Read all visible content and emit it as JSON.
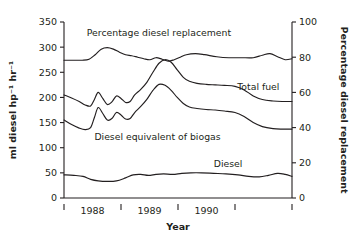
{
  "chart_data": {
    "type": "line",
    "title": "",
    "xlabel": "Year",
    "ylabel": "ml diesel hp⁻¹ hr⁻¹",
    "y2label": "Percentage diesel replacement",
    "xlim": [
      1987.75,
      1990.75
    ],
    "ylim": [
      0,
      350
    ],
    "y2lim": [
      0,
      100
    ],
    "grid": false,
    "legend": "inline-annotations",
    "yticks": [
      0,
      50,
      100,
      150,
      200,
      250,
      300,
      350
    ],
    "ytick_labels": [
      "0",
      "50",
      "100",
      "150",
      "200",
      "250",
      "300",
      "350"
    ],
    "y2ticks": [
      0,
      20,
      40,
      60,
      80,
      100
    ],
    "y2tick_labels": [
      "0",
      "20",
      "40",
      "60",
      "80",
      "100"
    ],
    "xticks": [
      1987.75,
      1988.5,
      1989.25,
      1990.0,
      1990.75
    ],
    "xtick_labels": [
      "",
      "1988",
      "1989",
      "1990",
      ""
    ],
    "xtick_text": [
      "1988",
      "1989",
      "1990"
    ],
    "series": [
      {
        "name": "Percentage diesel replacement",
        "axis": "right",
        "label_x": 1988.05,
        "label_y": 322,
        "x": [
          1987.75,
          1987.87,
          1987.99,
          1988.08,
          1988.16,
          1988.24,
          1988.32,
          1988.4,
          1988.48,
          1988.56,
          1988.64,
          1988.72,
          1988.8,
          1988.88,
          1988.96,
          1989.04,
          1989.12,
          1989.2,
          1989.28,
          1989.36,
          1989.48,
          1989.6,
          1989.76,
          1989.92,
          1990.08,
          1990.24,
          1990.36,
          1990.46,
          1990.56,
          1990.66,
          1990.75
        ],
        "values_left_scale": [
          274,
          274,
          274,
          276,
          285,
          296,
          299,
          296,
          290,
          285,
          283,
          280,
          277,
          275,
          279,
          276,
          272,
          275,
          280,
          285,
          287,
          285,
          281,
          279,
          279,
          279,
          284,
          287,
          281,
          275,
          277
        ]
      },
      {
        "name": "Total fuel",
        "axis": "left",
        "label_x": 1990.03,
        "label_y": 214,
        "x": [
          1987.75,
          1987.85,
          1987.95,
          1988.03,
          1988.1,
          1988.15,
          1988.2,
          1988.26,
          1988.32,
          1988.38,
          1988.44,
          1988.5,
          1988.56,
          1988.62,
          1988.68,
          1988.76,
          1988.84,
          1988.92,
          1989.0,
          1989.08,
          1989.16,
          1989.24,
          1989.32,
          1989.4,
          1989.5,
          1989.62,
          1989.74,
          1989.86,
          1990.0,
          1990.12,
          1990.24,
          1990.36,
          1990.5,
          1990.62,
          1990.75
        ],
        "values_left_scale": [
          205,
          199,
          192,
          185,
          183,
          196,
          210,
          198,
          186,
          191,
          203,
          198,
          190,
          192,
          205,
          216,
          230,
          250,
          268,
          275,
          270,
          255,
          240,
          232,
          228,
          226,
          225,
          224,
          222,
          215,
          203,
          196,
          193,
          192,
          192
        ]
      },
      {
        "name": "Diesel equivalent of biogas",
        "axis": "left",
        "label_x": 1988.15,
        "label_y": 116,
        "x": [
          1987.75,
          1987.85,
          1987.95,
          1988.03,
          1988.1,
          1988.15,
          1988.2,
          1988.26,
          1988.32,
          1988.38,
          1988.44,
          1988.5,
          1988.56,
          1988.62,
          1988.68,
          1988.76,
          1988.84,
          1988.92,
          1989.0,
          1989.08,
          1989.16,
          1989.24,
          1989.32,
          1989.4,
          1989.5,
          1989.62,
          1989.74,
          1989.86,
          1990.0,
          1990.12,
          1990.24,
          1990.36,
          1990.5,
          1990.62,
          1990.75
        ],
        "values_left_scale": [
          155,
          146,
          139,
          136,
          140,
          160,
          180,
          168,
          155,
          158,
          170,
          165,
          157,
          158,
          170,
          182,
          196,
          214,
          226,
          224,
          214,
          200,
          188,
          181,
          178,
          176,
          175,
          173,
          170,
          162,
          150,
          142,
          138,
          137,
          137
        ]
      },
      {
        "name": "Diesel",
        "axis": "left",
        "label_x": 1989.72,
        "label_y": 62,
        "x": [
          1987.75,
          1987.88,
          1988.0,
          1988.1,
          1988.2,
          1988.32,
          1988.44,
          1988.56,
          1988.66,
          1988.76,
          1988.86,
          1988.96,
          1989.06,
          1989.18,
          1989.3,
          1989.42,
          1989.56,
          1989.72,
          1989.88,
          1990.04,
          1990.18,
          1990.32,
          1990.44,
          1990.56,
          1990.66,
          1990.75
        ],
        "values_left_scale": [
          46,
          45,
          43,
          37,
          34,
          33,
          34,
          40,
          46,
          47,
          45,
          47,
          48,
          47,
          49,
          50,
          50,
          49,
          48,
          46,
          43,
          42,
          45,
          49,
          47,
          43
        ]
      }
    ]
  },
  "annotations": {
    "percentage_diesel_replacement": "Percentage diesel replacement",
    "total_fuel": "Total fuel",
    "diesel_equivalent_of_biogas": "Diesel equivalent of biogas",
    "diesel": "Diesel"
  },
  "colors": {
    "ink": "#231f20",
    "background": "#ffffff"
  }
}
